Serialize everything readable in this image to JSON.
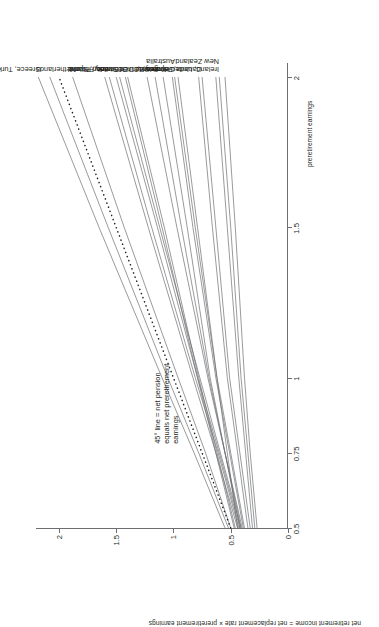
{
  "chart_data": {
    "type": "line",
    "title": "",
    "xlabel": "preretirement earnings",
    "ylabel": "net retirement income = net replacement rate × preretirement earnings",
    "xticks": [
      "0.5",
      "0.75",
      "1",
      "1.5",
      "2"
    ],
    "xtick_values": [
      0.5,
      0.75,
      1,
      1.5,
      2
    ],
    "yticks": [
      "0",
      "0.5",
      "1",
      "1.5",
      "2"
    ],
    "ytick_values": [
      0,
      0.5,
      1,
      1.5,
      2
    ],
    "xlim": [
      0.5,
      2.05
    ],
    "ylim": [
      0,
      2.2
    ],
    "grid": false,
    "legend": "end-of-line labels",
    "annotation": "45° line = net pension\nequals net preretirement\nearnings",
    "x": [
      0.5,
      0.75,
      1,
      1.5,
      2
    ],
    "reference_line": {
      "name": "45-degree line",
      "style": "dotted",
      "values": [
        0.5,
        0.75,
        1,
        1.5,
        2
      ]
    },
    "series": [
      {
        "name": "Greece, Turkey",
        "values": [
          0.55,
          0.82,
          1.1,
          1.65,
          2.18
        ]
      },
      {
        "name": "Greece, Turkey (2)",
        "values": [
          0.52,
          0.78,
          1.05,
          1.57,
          2.08
        ]
      },
      {
        "name": "Netherlands",
        "values": [
          0.5,
          0.72,
          0.96,
          1.43,
          1.88
        ]
      },
      {
        "name": "Italy, Poland",
        "values": [
          0.44,
          0.63,
          0.83,
          1.22,
          1.6
        ]
      },
      {
        "name": "Italy, Poland (2)",
        "values": [
          0.43,
          0.61,
          0.81,
          1.19,
          1.56
        ]
      },
      {
        "name": "Sweden, Spain",
        "values": [
          0.42,
          0.6,
          0.79,
          1.14,
          1.5
        ]
      },
      {
        "name": "Sweden, Spain (2)",
        "values": [
          0.41,
          0.59,
          0.77,
          1.12,
          1.47
        ]
      },
      {
        "name": "Denmark, Finland",
        "values": [
          0.47,
          0.63,
          0.79,
          1.1,
          1.42
        ]
      },
      {
        "name": "Denmark, Finland (2)",
        "values": [
          0.46,
          0.62,
          0.78,
          1.08,
          1.4
        ]
      },
      {
        "name": "OECD-30",
        "values": [
          0.4,
          0.55,
          0.7,
          0.97,
          1.23
        ]
      },
      {
        "name": "France",
        "values": [
          0.41,
          0.55,
          0.69,
          0.93,
          1.16
        ]
      },
      {
        "name": "Korea",
        "values": [
          0.42,
          0.55,
          0.68,
          0.88,
          1.09
        ]
      },
      {
        "name": "Germany, United States",
        "values": [
          0.39,
          0.51,
          0.63,
          0.83,
          1.01
        ]
      },
      {
        "name": "Germany, United States (2)",
        "values": [
          0.38,
          0.5,
          0.62,
          0.81,
          0.99
        ]
      },
      {
        "name": "Australia",
        "values": [
          0.44,
          0.53,
          0.62,
          0.79,
          0.96
        ]
      },
      {
        "name": "Canada, Japan",
        "values": [
          0.35,
          0.44,
          0.53,
          0.66,
          0.78
        ]
      },
      {
        "name": "Canada, Japan (2)",
        "values": [
          0.33,
          0.42,
          0.51,
          0.63,
          0.75
        ]
      },
      {
        "name": "Ireland, United Kingdom",
        "values": [
          0.31,
          0.37,
          0.43,
          0.53,
          0.63
        ]
      },
      {
        "name": "Ireland, United Kingdom (2)",
        "values": [
          0.29,
          0.35,
          0.41,
          0.5,
          0.6
        ]
      },
      {
        "name": "New Zealand",
        "values": [
          0.27,
          0.33,
          0.38,
          0.46,
          0.55
        ]
      }
    ],
    "end_labels": [
      {
        "label": "Greece, Turkey",
        "at": 2.18
      },
      {
        "label": "Netherlands",
        "at": 1.88
      },
      {
        "label": "Italy, Poland",
        "at": 1.6
      },
      {
        "label": "Sweden, Spain",
        "at": 1.5
      },
      {
        "label": "Denmark, Finland",
        "at": 1.42
      },
      {
        "label": "OECD-30",
        "at": 1.23
      },
      {
        "label": "France",
        "at": 1.16
      },
      {
        "label": "Korea",
        "at": 1.09
      },
      {
        "label": "Germany, United States,\nAustralia",
        "at": 1.01
      },
      {
        "label": "Canada, Japan",
        "at": 0.78
      },
      {
        "label": "Ireland, United Kingdom,\nNew Zealand",
        "at": 0.63
      }
    ],
    "colors": {
      "line": "#6d6e71",
      "reference": "#231f20",
      "axis": "#6d6e71",
      "text": "#231f20",
      "background": "#ffffff"
    }
  }
}
